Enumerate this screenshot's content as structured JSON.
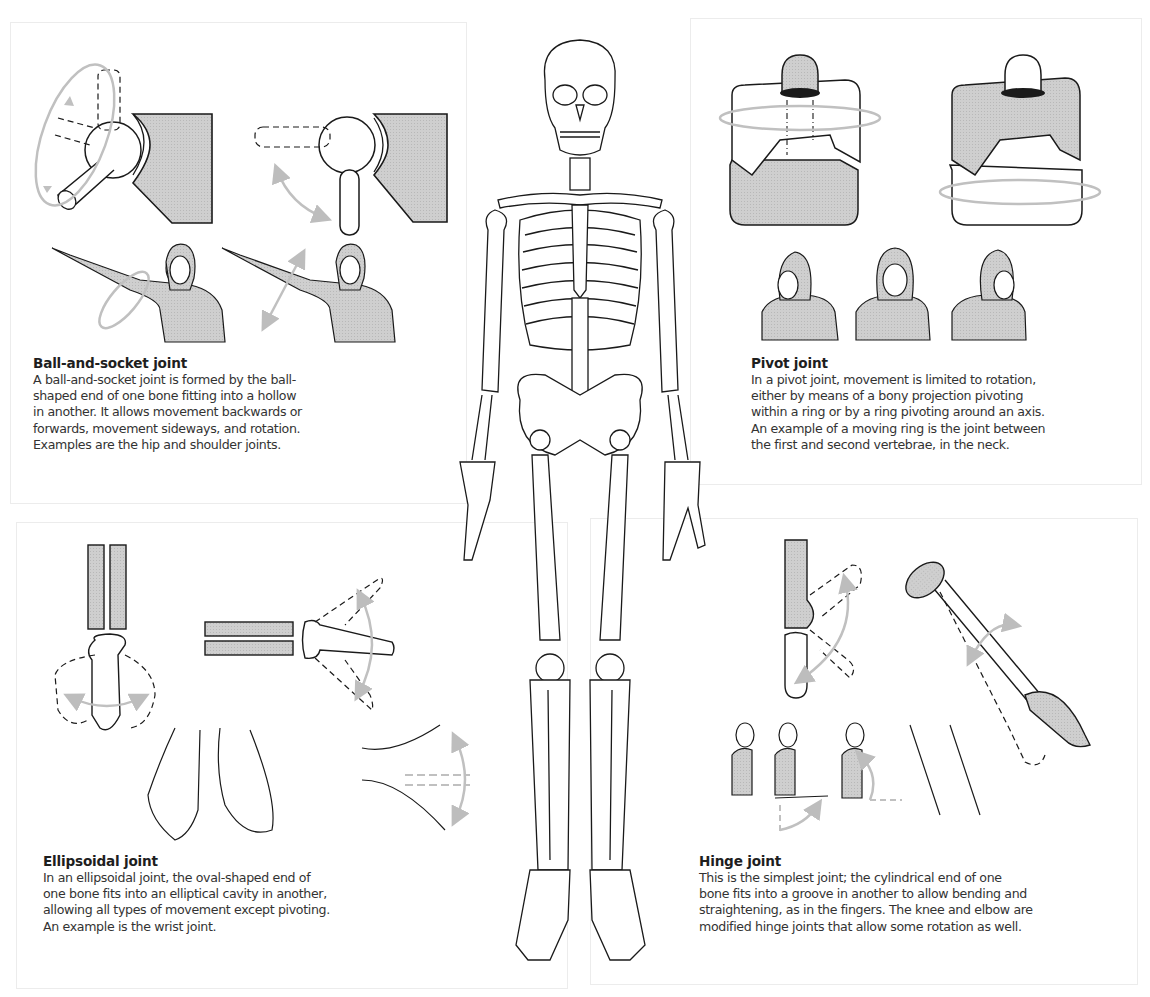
{
  "figure": {
    "central_image": "full human skeleton, front view",
    "colors": {
      "line": "#1a1a1a",
      "fill_gray": "#c9c9c9",
      "arrow_gray": "#bdbdbd",
      "panel_border": "#ececec",
      "text": "#2a2a2a"
    }
  },
  "panels": {
    "ball_socket": {
      "title": "Ball-and-socket joint",
      "lines": [
        "A ball-and-socket joint is formed by the ball-",
        "shaped end of one bone fitting into a hollow",
        "in another. It allows movement backwards or",
        "forwards, movement sideways, and rotation.",
        "Examples are the hip and shoulder joints."
      ]
    },
    "pivot": {
      "title": "Pivot joint",
      "lines": [
        "In a pivot joint, movement is limited to rotation,",
        "either by means of a bony projection pivoting",
        "within a ring or by a ring pivoting around an axis.",
        "An example of a moving ring is the joint between",
        "the first and second vertebrae, in the neck."
      ]
    },
    "ellipsoidal": {
      "title": "Ellipsoidal joint",
      "lines": [
        "In an ellipsoidal joint, the oval-shaped end of",
        "one bone fits into an elliptical cavity in another,",
        "allowing all types of movement except pivoting.",
        "An example is the wrist joint."
      ]
    },
    "hinge": {
      "title": "Hinge joint",
      "lines": [
        "This is the simplest joint; the cylindrical end of one",
        "bone fits into a groove in another to allow bending and",
        "straightening, as in the fingers. The knee and elbow are",
        "modified hinge joints that allow some rotation as well."
      ]
    }
  }
}
